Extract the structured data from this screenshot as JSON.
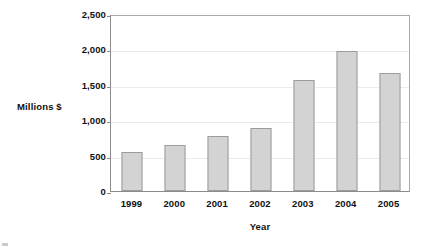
{
  "chart_data": {
    "type": "bar",
    "title": "",
    "xlabel": "Year",
    "ylabel": "Millions $",
    "categories": [
      "1999",
      "2000",
      "2001",
      "2002",
      "2003",
      "2004",
      "2005"
    ],
    "values": [
      545,
      650,
      775,
      885,
      1570,
      1980,
      1670
    ],
    "series": [
      {
        "name": "Millions $",
        "values": [
          545,
          650,
          775,
          885,
          1570,
          1980,
          1670
        ]
      }
    ],
    "ylim": [
      0,
      2500
    ],
    "ytick_values": [
      0,
      500,
      1000,
      1500,
      2000,
      2500
    ],
    "ytick_labels": [
      "0",
      "500",
      "1,000",
      "1,500",
      "2,000",
      "2,500"
    ],
    "grid": true,
    "grid_axis": "y",
    "legend": false,
    "legend_position": "none",
    "bar_fill_color": "#d3d3d3",
    "bar_border_color": "#9c9c9c",
    "gridline_color": "#ebebeb",
    "axis_color": "#8c8c8c",
    "plot_border_color": "#a9a9a9",
    "text_color": "#111111",
    "background_color": "#ffffff"
  },
  "axes": {
    "y_title": "Millions $",
    "x_title": "Year"
  },
  "ticks": {
    "y": [
      {
        "label": "2,500",
        "value": 2500
      },
      {
        "label": "2,000",
        "value": 2000
      },
      {
        "label": "1,500",
        "value": 1500
      },
      {
        "label": "1,000",
        "value": 1000
      },
      {
        "label": "500",
        "value": 500
      },
      {
        "label": "0",
        "value": 0
      }
    ],
    "x": [
      "1999",
      "2000",
      "2001",
      "2002",
      "2003",
      "2004",
      "2005"
    ]
  }
}
